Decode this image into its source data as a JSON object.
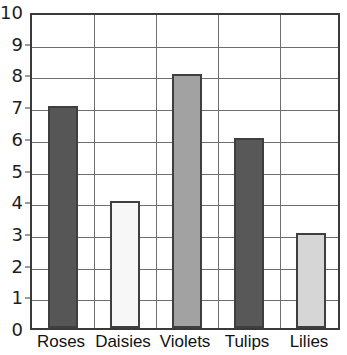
{
  "chart_data": {
    "type": "bar",
    "title": "",
    "xlabel": "",
    "ylabel": "",
    "categories": [
      "Roses",
      "Daisies",
      "Violets",
      "Tulips",
      "Lilies"
    ],
    "values": [
      7,
      4,
      8,
      6,
      3
    ],
    "bar_colors": [
      "#565656",
      "#f7f7f7",
      "#a2a2a2",
      "#585858",
      "#d6d6d6"
    ],
    "bar_outline_color": "#3f3f3f",
    "ylim": [
      0,
      10
    ],
    "ytick_step": 1,
    "yticks": [
      "0",
      "1",
      "2",
      "3",
      "4",
      "5",
      "6",
      "7",
      "8",
      "9",
      "10"
    ],
    "grid": true,
    "grid_color": "#6e6e6e",
    "frame_color": "#3a3a3a",
    "legend": "none",
    "background": "#ffffff"
  },
  "axes": {
    "y_axis_name": "y-axis",
    "x_axis_name": "x-axis"
  }
}
